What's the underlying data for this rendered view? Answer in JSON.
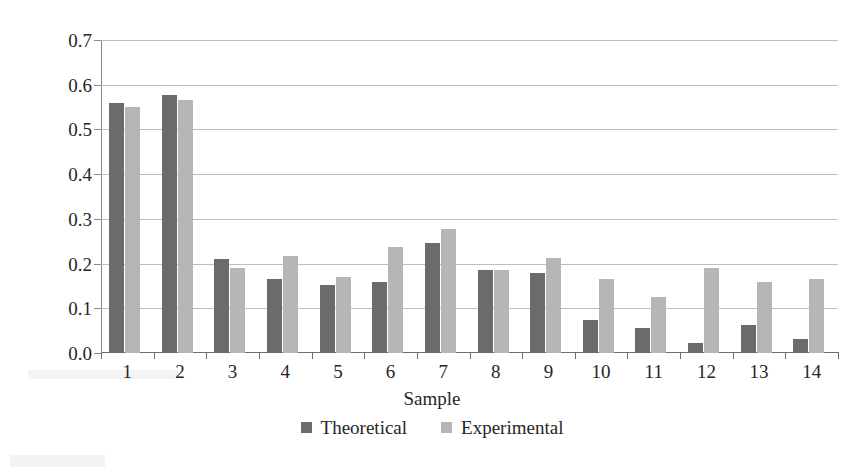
{
  "chart_data": {
    "type": "bar",
    "title": "",
    "xlabel": "Sample",
    "ylabel": "Pore diameter, mm",
    "categories": [
      "1",
      "2",
      "3",
      "4",
      "5",
      "6",
      "7",
      "8",
      "9",
      "10",
      "11",
      "12",
      "13",
      "14"
    ],
    "series": [
      {
        "name": "Theoretical",
        "color": "#6b6b6b",
        "values": [
          0.56,
          0.578,
          0.21,
          0.166,
          0.153,
          0.158,
          0.245,
          0.185,
          0.178,
          0.073,
          0.057,
          0.022,
          0.062,
          0.032
        ]
      },
      {
        "name": "Experimental",
        "color": "#b6b6b6",
        "values": [
          0.551,
          0.565,
          0.191,
          0.217,
          0.171,
          0.236,
          0.277,
          0.186,
          0.212,
          0.165,
          0.125,
          0.19,
          0.158,
          0.165
        ]
      }
    ],
    "ylim": [
      0.0,
      0.7
    ],
    "ytick_labels": [
      "0.7",
      "0.6",
      "0.5",
      "0.4",
      "0.3",
      "0.2",
      "0.1",
      "0.0"
    ],
    "ytick_values": [
      0.7,
      0.6,
      0.5,
      0.4,
      0.3,
      0.2,
      0.1,
      0.0
    ],
    "grid": "horizontal",
    "legend_position": "bottom-center"
  },
  "legend": {
    "items": [
      {
        "label": "Theoretical",
        "color": "#6b6b6b"
      },
      {
        "label": "Experimental",
        "color": "#b6b6b6"
      }
    ]
  },
  "axes": {
    "y_title": "Pore diameter, mm",
    "x_title": "Sample"
  },
  "colors": {
    "theoretical": "#6b6b6b",
    "experimental": "#b6b6b6",
    "gridline": "#bdbdbd",
    "axis": "#6e6e6e",
    "text": "#262626",
    "background": "#ffffff"
  }
}
